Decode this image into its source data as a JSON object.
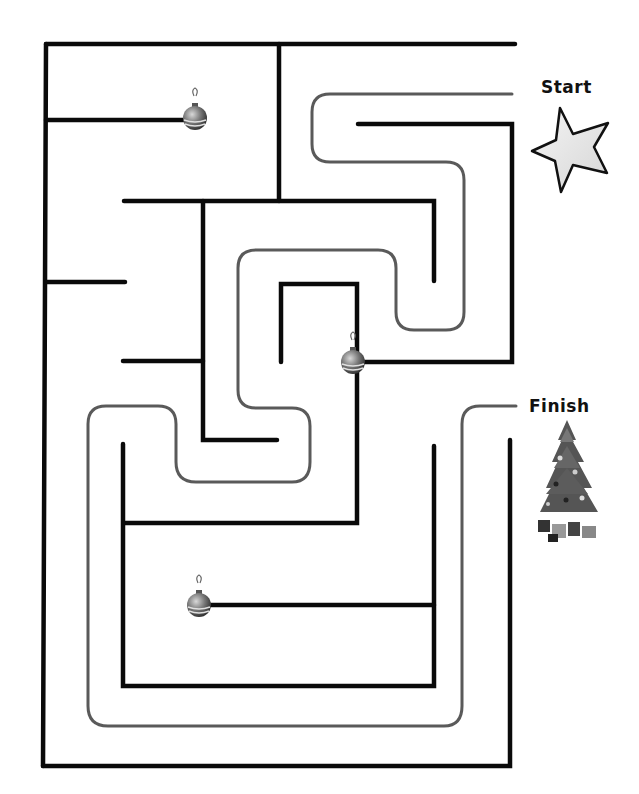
{
  "puzzle": {
    "type": "maze",
    "theme": "christmas",
    "start_label": "Start",
    "finish_label": "Finish",
    "start_marker": "star-icon",
    "finish_marker": "christmas-tree-icon",
    "decorations": [
      "ornament-icon",
      "ornament-icon",
      "ornament-icon"
    ],
    "solution_path_shown": true
  },
  "colors": {
    "wall": "#0a0a0a",
    "solution_path": "#5a5a5a",
    "background": "#ffffff",
    "star_fill": "#e8e8e8",
    "tree": "#4a4a4a"
  }
}
